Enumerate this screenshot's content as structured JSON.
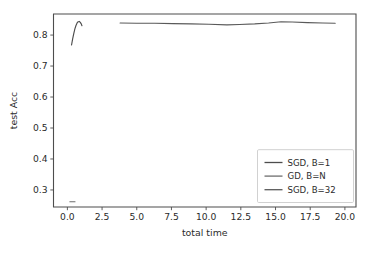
{
  "chart_data": {
    "type": "line",
    "title": "",
    "xlabel": "total time",
    "ylabel": "test Acc",
    "xlim": [
      -1.0,
      20.8
    ],
    "ylim": [
      0.245,
      0.868
    ],
    "grid": false,
    "legend_position": "lower right",
    "xticks": [
      "0.0",
      "2.5",
      "5.0",
      "7.5",
      "10.0",
      "12.5",
      "15.0",
      "17.5",
      "20.0"
    ],
    "xtick_values": [
      0.0,
      2.5,
      5.0,
      7.5,
      10.0,
      12.5,
      15.0,
      17.5,
      20.0
    ],
    "yticks": [
      "0.3",
      "0.4",
      "0.5",
      "0.6",
      "0.7",
      "0.8"
    ],
    "ytick_values": [
      0.3,
      0.4,
      0.5,
      0.6,
      0.7,
      0.8
    ],
    "series": [
      {
        "name": "SGD, B=1",
        "color": "#4d4d4d",
        "x": [
          0.3,
          0.38,
          0.46,
          0.54,
          0.62,
          0.7,
          0.78,
          0.86,
          0.93,
          1.0,
          1.05
        ],
        "y": [
          0.768,
          0.788,
          0.805,
          0.82,
          0.831,
          0.839,
          0.843,
          0.844,
          0.841,
          0.836,
          0.83
        ]
      },
      {
        "name": "GD, B=N",
        "color": "#6e6e6e",
        "x": [
          0.18,
          0.3,
          0.42,
          0.55
        ],
        "y": [
          0.262,
          0.262,
          0.262,
          0.262
        ]
      },
      {
        "name": "SGD, B=32",
        "color": "#5a5a5a",
        "x": [
          3.8,
          5.0,
          6.3,
          7.6,
          8.9,
          10.2,
          11.5,
          12.4,
          13.5,
          14.5,
          15.4,
          16.2,
          17.3,
          18.4,
          19.3
        ],
        "y": [
          0.839,
          0.838,
          0.838,
          0.837,
          0.836,
          0.835,
          0.833,
          0.834,
          0.836,
          0.839,
          0.843,
          0.842,
          0.84,
          0.839,
          0.838
        ]
      }
    ]
  },
  "legend": {
    "entries": [
      {
        "label": "SGD, B=1"
      },
      {
        "label": "GD, B=N"
      },
      {
        "label": "SGD, B=32"
      }
    ]
  },
  "axes": {
    "x_title": "total time",
    "y_title": "test Acc"
  }
}
